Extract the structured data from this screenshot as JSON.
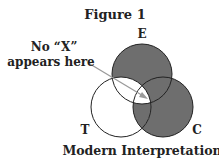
{
  "figure": {
    "title": "Figure 1",
    "caption": "Modern Interpretation",
    "annotation_line1": "No “X”",
    "annotation_line2": "appears here"
  },
  "venn": {
    "circles": [
      {
        "label": "E",
        "cx": 142,
        "cy": 74,
        "r": 30
      },
      {
        "label": "T",
        "cx": 121,
        "cy": 107,
        "r": 30
      },
      {
        "label": "C",
        "cx": 163,
        "cy": 107,
        "r": 30
      }
    ],
    "regions": {
      "E_only": "shaded",
      "C_only": "shaded",
      "T_only": "unshaded",
      "E_and_C_not_T": "shaded",
      "T_and_C_not_E": "shaded",
      "T_and_E_not_C": "unshaded",
      "T_E_C": "unshaded"
    },
    "colors": {
      "shaded": "#6e6e6e",
      "unshaded": "#ffffff",
      "stroke": "#222222",
      "arrow": "#9a9a9a"
    }
  }
}
